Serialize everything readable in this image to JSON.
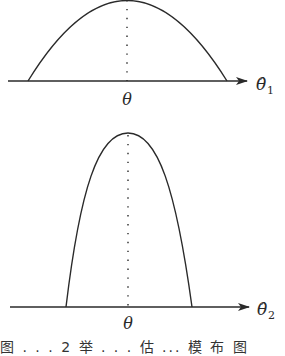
{
  "figure": {
    "panels": [
      {
        "id": "top",
        "estimator_label": "θ̂",
        "estimator_subscript": "1",
        "center_label": "θ",
        "shape": "wide parabola (large variance)"
      },
      {
        "id": "bottom",
        "estimator_label": "θ̂",
        "estimator_subscript": "2",
        "center_label": "θ",
        "shape": "narrow parabola (small variance)"
      }
    ],
    "caption": "图 . . . 2 举 . . . 估 ... 模 布 图"
  },
  "colors": {
    "stroke": "#2a2a2a",
    "background": "#ffffff"
  }
}
